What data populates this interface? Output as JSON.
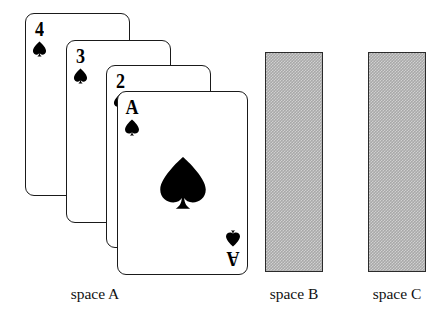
{
  "scene": {
    "title": "Tower of Hanoi style card layout with three spaces",
    "background_color": "#ffffff",
    "ink_color": "#000000",
    "slot_fill_color": "#a8a8a8",
    "slot_border_color": "#2b2b2b"
  },
  "spaces": [
    {
      "id": "A",
      "label": "space A",
      "state": "occupied",
      "card_count": 4
    },
    {
      "id": "B",
      "label": "space B",
      "state": "empty",
      "card_count": 0
    },
    {
      "id": "C",
      "label": "space C",
      "state": "empty",
      "card_count": 0
    }
  ],
  "cards": [
    {
      "rank": "4",
      "suit": "spades",
      "suit_symbol": "♠",
      "name": "four-of-spades",
      "stack_index": 0,
      "x": 25,
      "y": 13,
      "width": 105,
      "height": 183
    },
    {
      "rank": "3",
      "suit": "spades",
      "suit_symbol": "♠",
      "name": "three-of-spades",
      "stack_index": 1,
      "x": 66,
      "y": 40,
      "width": 105,
      "height": 183
    },
    {
      "rank": "2",
      "suit": "spades",
      "suit_symbol": "♠",
      "name": "two-of-spades",
      "stack_index": 2,
      "x": 106,
      "y": 65,
      "width": 105,
      "height": 183
    },
    {
      "rank": "A",
      "suit": "spades",
      "suit_symbol": "♠",
      "name": "ace-of-spades",
      "stack_index": 3,
      "x": 117,
      "y": 91,
      "width": 131,
      "height": 184,
      "has_center_pip": true
    }
  ],
  "slots": [
    {
      "space_id": "B",
      "x": 265,
      "y": 52,
      "width": 58,
      "height": 220
    },
    {
      "space_id": "C",
      "x": 368,
      "y": 52,
      "width": 58,
      "height": 220
    }
  ],
  "labels": [
    {
      "text": "space A",
      "center_x": 95,
      "y": 285
    },
    {
      "text": "space B",
      "center_x": 294,
      "y": 285
    },
    {
      "text": "space C",
      "center_x": 397,
      "y": 285
    }
  ]
}
